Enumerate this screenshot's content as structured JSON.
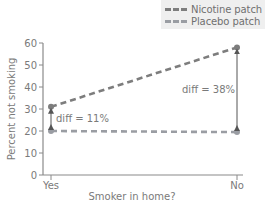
{
  "chart_data": {
    "type": "line",
    "title": "",
    "xlabel": "Smoker in home?",
    "ylabel": "Percent not smoking",
    "categories": [
      "Yes",
      "No"
    ],
    "ylim": [
      0,
      60
    ],
    "yticks": [
      0,
      10,
      20,
      30,
      40,
      50,
      60
    ],
    "grid": false,
    "legend_position": "top-right",
    "series": [
      {
        "name": "Nicotine patch",
        "values": [
          31,
          58
        ],
        "color": "#7d7d7d",
        "style": "dashed"
      },
      {
        "name": "Placebo patch",
        "values": [
          20,
          19.5
        ],
        "color": "#9a9da3",
        "style": "dashed"
      }
    ],
    "annotations": [
      {
        "text": "diff = 11%",
        "category": "Yes",
        "from": 20,
        "to": 31
      },
      {
        "text": "diff = 38%",
        "category": "No",
        "from": 19.5,
        "to": 58
      }
    ]
  },
  "legend": {
    "items": [
      {
        "label": "Nicotine patch",
        "color": "#7d7d7d"
      },
      {
        "label": "Placebo patch",
        "color": "#9a9da3"
      }
    ]
  }
}
